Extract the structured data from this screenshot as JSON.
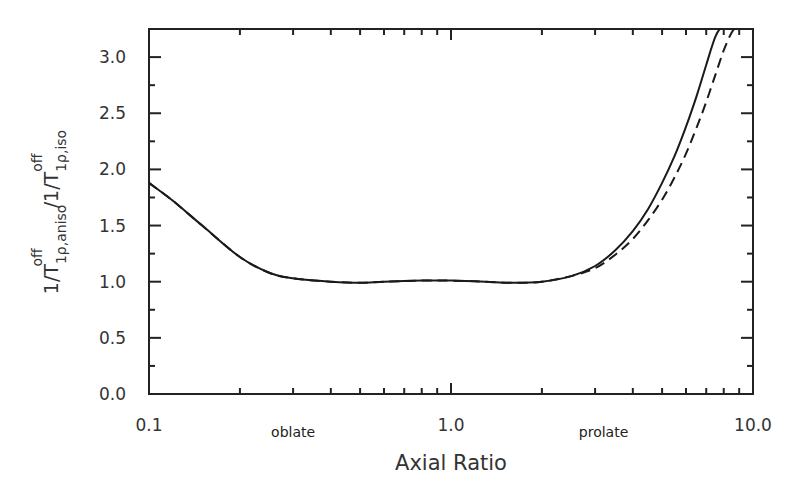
{
  "chart_data": {
    "type": "line",
    "title": "",
    "xlabel": "Axial Ratio",
    "ylabel": "1/T1ρ,aniso^off / 1/T1ρ,iso^off",
    "ylabel_parts": {
      "num_main": "1/T",
      "num_sub": "1ρ,aniso",
      "num_sup": "off",
      "sep": " /1/T",
      "den_sub": "1ρ,iso",
      "den_sup": "off"
    },
    "xscale": "log",
    "xlim": [
      0.1,
      10.0
    ],
    "ylim": [
      0.0,
      3.25
    ],
    "x_tick_labels": [
      "0.1",
      "1.0",
      "10.0"
    ],
    "x_ticks": [
      0.1,
      1.0,
      10.0
    ],
    "y_tick_labels": [
      "0.0",
      "0.5",
      "1.0",
      "1.5",
      "2.0",
      "2.5",
      "3.0"
    ],
    "y_ticks": [
      0.0,
      0.5,
      1.0,
      1.5,
      2.0,
      2.5,
      3.0
    ],
    "annotations": [
      {
        "text": "oblate",
        "x": 0.3
      },
      {
        "text": "prolate",
        "x": 3.2
      }
    ],
    "grid": false,
    "legend": "none",
    "series": [
      {
        "name": "solid",
        "style": "solid",
        "x": [
          0.1,
          0.12,
          0.15,
          0.2,
          0.25,
          0.3,
          0.4,
          0.5,
          0.6,
          0.8,
          1.0,
          1.3,
          1.6,
          2.0,
          2.5,
          3.0,
          3.5,
          4.0,
          4.5,
          5.0,
          5.5,
          6.0,
          6.5,
          7.0,
          7.5,
          7.9
        ],
        "y": [
          1.88,
          1.72,
          1.5,
          1.22,
          1.08,
          1.03,
          1.0,
          0.99,
          1.0,
          1.01,
          1.01,
          1.0,
          0.99,
          1.0,
          1.05,
          1.14,
          1.28,
          1.45,
          1.65,
          1.88,
          2.12,
          2.38,
          2.65,
          2.93,
          3.18,
          3.28
        ]
      },
      {
        "name": "dashed",
        "style": "dashed",
        "x": [
          0.1,
          0.12,
          0.15,
          0.2,
          0.25,
          0.3,
          0.4,
          0.5,
          0.6,
          0.8,
          1.0,
          1.3,
          1.6,
          2.0,
          2.5,
          3.0,
          3.5,
          4.0,
          4.5,
          5.0,
          5.5,
          6.0,
          6.5,
          7.0,
          7.5,
          8.0,
          8.5,
          8.9
        ],
        "y": [
          1.88,
          1.72,
          1.5,
          1.22,
          1.08,
          1.03,
          1.0,
          0.99,
          1.0,
          1.01,
          1.01,
          1.0,
          0.99,
          1.0,
          1.05,
          1.12,
          1.24,
          1.38,
          1.55,
          1.73,
          1.93,
          2.14,
          2.37,
          2.6,
          2.84,
          3.06,
          3.22,
          3.28
        ]
      }
    ]
  }
}
